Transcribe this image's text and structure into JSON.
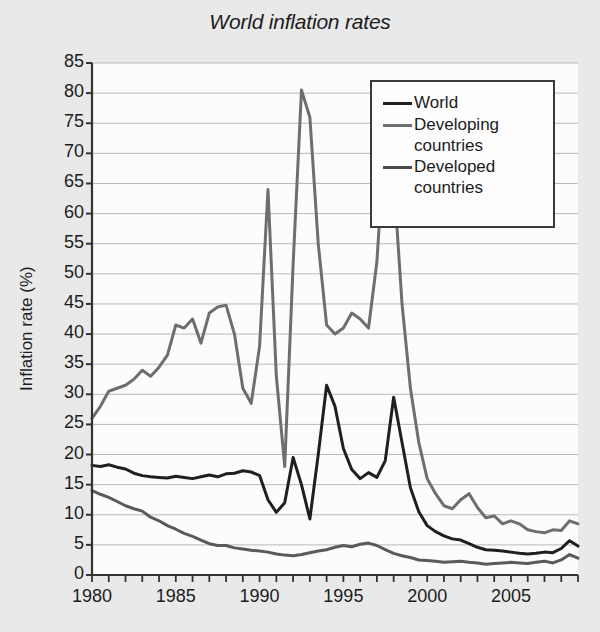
{
  "chart_data": {
    "type": "line",
    "title": "World inflation rates",
    "xlabel": "",
    "ylabel": "Inflation rate (%)",
    "xlim": [
      1980,
      2009
    ],
    "ylim": [
      0,
      85
    ],
    "ytick_labels": [
      "85",
      "80",
      "75",
      "70",
      "65",
      "60",
      "55",
      "50",
      "45",
      "40",
      "35",
      "30",
      "25",
      "20",
      "15",
      "10",
      "5",
      "0"
    ],
    "ytick_values": [
      85,
      80,
      75,
      70,
      65,
      60,
      55,
      50,
      45,
      40,
      35,
      30,
      25,
      20,
      15,
      10,
      5,
      0
    ],
    "xtick_labels": [
      "1980",
      "1985",
      "1990",
      "1995",
      "2000",
      "2005"
    ],
    "xtick_values": [
      1980,
      1985,
      1990,
      1995,
      2000,
      2005
    ],
    "x_minor_step": 1,
    "grid": "horizontal",
    "legend_position": "top-right",
    "x": [
      1980,
      1980.5,
      1981,
      1981.5,
      1982,
      1982.5,
      1983,
      1983.5,
      1984,
      1984.5,
      1985,
      1985.5,
      1986,
      1986.5,
      1987,
      1987.5,
      1988,
      1988.5,
      1989,
      1989.5,
      1990,
      1990.5,
      1991,
      1991.5,
      1992,
      1992.5,
      1993,
      1993.5,
      1994,
      1994.5,
      1995,
      1995.5,
      1996,
      1996.5,
      1997,
      1997.5,
      1998,
      1998.5,
      1999,
      1999.5,
      2000,
      2000.5,
      2001,
      2001.5,
      2002,
      2002.5,
      2003,
      2003.5,
      2004,
      2004.5,
      2005,
      2005.5,
      2006,
      2006.5,
      2007,
      2007.5,
      2008,
      2008.5,
      2009
    ],
    "series": [
      {
        "name": "World",
        "color": "#1f1f1f",
        "width": 3.0,
        "values": [
          18.2,
          18.0,
          18.3,
          17.9,
          17.6,
          16.9,
          16.5,
          16.3,
          16.2,
          16.1,
          16.4,
          16.2,
          16.0,
          16.3,
          16.6,
          16.3,
          16.8,
          16.9,
          17.3,
          17.1,
          16.5,
          12.5,
          10.4,
          12.0,
          19.5,
          15.0,
          9.3,
          20.0,
          31.5,
          28.0,
          21.0,
          17.5,
          16.0,
          17.0,
          16.2,
          19.0,
          29.5,
          22.0,
          14.5,
          10.5,
          8.2,
          7.2,
          6.5,
          6.0,
          5.8,
          5.2,
          4.6,
          4.2,
          4.1,
          4.0,
          3.8,
          3.6,
          3.5,
          3.6,
          3.8,
          3.7,
          4.4,
          5.7,
          4.8
        ]
      },
      {
        "name": "Developing\ncountries",
        "color": "#6e6e6e",
        "width": 3.0,
        "values": [
          26.0,
          28.0,
          30.5,
          31.0,
          31.5,
          32.5,
          34.0,
          33.0,
          34.5,
          36.5,
          41.5,
          41.0,
          42.5,
          38.5,
          43.5,
          44.5,
          44.8,
          40.0,
          31.0,
          28.5,
          38.0,
          64.0,
          33.0,
          18.0,
          51.5,
          80.5,
          76.0,
          55.0,
          41.5,
          40.0,
          41.0,
          43.5,
          42.5,
          41.0,
          52.0,
          74.0,
          66.0,
          45.0,
          31.0,
          22.0,
          16.0,
          13.5,
          11.5,
          11.0,
          12.5,
          13.5,
          11.2,
          9.5,
          9.8,
          8.5,
          9.0,
          8.5,
          7.5,
          7.2,
          7.0,
          7.5,
          7.4,
          9.0,
          8.5
        ]
      },
      {
        "name": "Developed\ncountries",
        "color": "#5a5a5a",
        "width": 3.0,
        "values": [
          14.0,
          13.4,
          12.9,
          12.2,
          11.5,
          11.0,
          10.6,
          9.6,
          9.0,
          8.2,
          7.6,
          6.9,
          6.4,
          5.8,
          5.2,
          4.9,
          4.9,
          4.5,
          4.3,
          4.1,
          4.0,
          3.8,
          3.5,
          3.3,
          3.2,
          3.4,
          3.7,
          4.0,
          4.2,
          4.6,
          4.9,
          4.7,
          5.1,
          5.3,
          4.9,
          4.2,
          3.6,
          3.2,
          2.9,
          2.5,
          2.4,
          2.3,
          2.1,
          2.2,
          2.3,
          2.1,
          2.0,
          1.8,
          1.9,
          2.0,
          2.1,
          2.0,
          1.9,
          2.1,
          2.3,
          2.0,
          2.5,
          3.4,
          2.8
        ]
      }
    ]
  },
  "legend": {
    "entries": [
      {
        "label": "World",
        "color": "#1f1f1f"
      },
      {
        "label": "Developing\ncountries",
        "color": "#6e6e6e"
      },
      {
        "label": "Developed\ncountries",
        "color": "#4a4a4a"
      }
    ]
  },
  "colors": {
    "background": "#e9e9e9",
    "plot_background": "#fcfcfc",
    "grid": "#b9b9b9",
    "axis": "#333333"
  }
}
